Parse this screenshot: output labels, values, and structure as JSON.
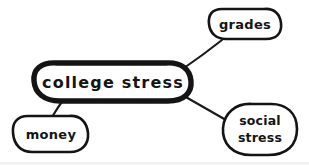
{
  "diagram": {
    "type": "mind-map",
    "style": "hand-drawn",
    "background_color": "#ffffff",
    "ink_color": "#141414",
    "central_node": {
      "id": "college-stress",
      "label": "college stress",
      "shape": "rounded-oval",
      "emphasis": "thick-outline",
      "center_x": 113,
      "center_y": 82,
      "width": 154,
      "height": 38
    },
    "leaf_nodes": [
      {
        "id": "grades",
        "label": "grades",
        "shape": "rounded-oval",
        "center_x": 245,
        "center_y": 24,
        "width": 74,
        "height": 32,
        "lines": [
          "grades"
        ]
      },
      {
        "id": "money",
        "label": "money",
        "shape": "rounded-oval",
        "center_x": 51,
        "center_y": 134,
        "width": 78,
        "height": 37,
        "lines": [
          "money"
        ]
      },
      {
        "id": "social-stress",
        "label": "social stress",
        "shape": "rounded-blob",
        "center_x": 260,
        "center_y": 129,
        "width": 76,
        "height": 52,
        "lines": [
          "social",
          "stress"
        ]
      }
    ],
    "edges": [
      {
        "id": "edge-central-grades",
        "from": "college-stress",
        "to": "grades",
        "x1": 183,
        "y1": 68,
        "x2": 222,
        "y2": 39
      },
      {
        "id": "edge-central-money",
        "from": "college-stress",
        "to": "money",
        "x1": 64,
        "y1": 99,
        "x2": 52,
        "y2": 116
      },
      {
        "id": "edge-central-social",
        "from": "college-stress",
        "to": "social-stress",
        "x1": 183,
        "y1": 96,
        "x2": 225,
        "y2": 120
      }
    ],
    "counts": {
      "nodes_total": 4,
      "leaf_nodes": 3,
      "edges": 3
    }
  }
}
